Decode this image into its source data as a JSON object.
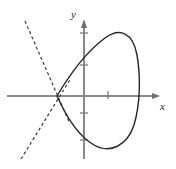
{
  "figure": {
    "width": 176,
    "height": 169,
    "background": "#ffffff"
  },
  "axes": {
    "x_label": "x",
    "y_label": "y",
    "origin": {
      "x": 84,
      "y": 96
    },
    "axis_color": "#8a8a8a",
    "x_axis": {
      "x1": 7,
      "y1": 96,
      "x2": 160,
      "y2": 96,
      "arrow": "right"
    },
    "y_axis": {
      "x1": 84,
      "y1": 159,
      "x2": 84,
      "y2": 20,
      "arrow": "up"
    },
    "x_ticks": [
      {
        "pos": 108,
        "length": 7
      }
    ],
    "y_ticks": [
      {
        "pos": 33,
        "length": 8
      },
      {
        "pos": 65,
        "length": 8
      },
      {
        "pos": 113,
        "length": 8
      },
      {
        "pos": 140,
        "length": 8
      }
    ]
  },
  "chart_data": {
    "type": "line",
    "title": "",
    "xlabel": "x",
    "ylabel": "y",
    "grid": false,
    "legend": null,
    "series": [
      {
        "name": "curve",
        "style": "solid",
        "color": "#262626",
        "width": 1.4,
        "node": {
          "x": 57,
          "y": 96
        },
        "extrema": {
          "right_x": 137,
          "top_y": 32,
          "bottom_y": 148,
          "top_x": 113,
          "bottom_x": 113
        },
        "path": "M 57 96 C 70 74 86 52 105 38 C 120 27 133 33 137 55 C 141 78 140 105 134 125 C 127 146 110 154 94 145 C 78 136 66 116 57 96 Z"
      },
      {
        "name": "tangent-upper",
        "style": "dashed",
        "color": "#3a3a3a",
        "width": 1.2,
        "dash": "3,2.6",
        "from": {
          "x": 25,
          "y": 21
        },
        "to": {
          "x": 70,
          "y": 124
        }
      },
      {
        "name": "tangent-lower",
        "style": "dashed",
        "color": "#3a3a3a",
        "width": 1.2,
        "dash": "3,2.6",
        "from": {
          "x": 21,
          "y": 159
        },
        "to": {
          "x": 71,
          "y": 78
        }
      }
    ]
  }
}
